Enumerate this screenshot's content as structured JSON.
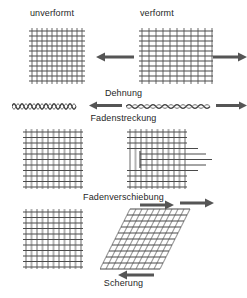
{
  "figure": {
    "title_columns": {
      "undeformed": "unverformt",
      "deformed": "verformt"
    },
    "modes": [
      {
        "id": "dehnung",
        "label": "Dehnung",
        "description_icons": [
          "grid-square-undeformed",
          "grid-stretched-horizontal",
          "arrow-left",
          "arrow-right"
        ]
      },
      {
        "id": "fadenstreckung",
        "label": "Fadenstreckung",
        "description_icons": [
          "thread-crimped",
          "thread-straightened",
          "arrow-left",
          "arrow-right"
        ]
      },
      {
        "id": "fadenverschiebung",
        "label": "Fadenverschiebung",
        "description_icons": [
          "grid-square-undeformed",
          "grid-thread-slip",
          "arrow-right"
        ]
      },
      {
        "id": "scherung",
        "label": "Scherung",
        "description_icons": [
          "grid-square-undeformed",
          "grid-sheared-parallelogram",
          "arrow-right",
          "arrow-left"
        ]
      }
    ],
    "colors": {
      "grid_line_dark": "#4a4a4a",
      "grid_line_light": "#b4b4b4",
      "arrow": "#555555",
      "text": "#1f1f1f",
      "background": "#ffffff"
    },
    "grid": {
      "cells_x": 11,
      "cells_y": 11,
      "cell_size_px": 5
    }
  }
}
